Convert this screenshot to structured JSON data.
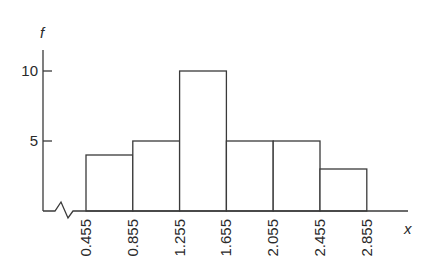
{
  "chart_data": {
    "type": "bar",
    "subtype": "histogram",
    "title": "",
    "xlabel": "x",
    "ylabel": "f",
    "bin_edges": [
      0.455,
      0.855,
      1.255,
      1.655,
      2.055,
      2.455,
      2.855
    ],
    "x_tick_labels": [
      "0.455",
      "0.855",
      "1.255",
      "1.655",
      "2.055",
      "2.455",
      "2.855"
    ],
    "categories": [
      "0.455–0.855",
      "0.855–1.255",
      "1.255–1.655",
      "1.655–2.055",
      "2.055–2.455",
      "2.455–2.855"
    ],
    "values": [
      4,
      5,
      10,
      5,
      5,
      3
    ],
    "y_ticks": [
      5,
      10
    ],
    "y_tick_labels": [
      "5",
      "10"
    ],
    "ylim": [
      0,
      11.5
    ],
    "grid": false,
    "legend": null,
    "x_axis_break": true
  }
}
